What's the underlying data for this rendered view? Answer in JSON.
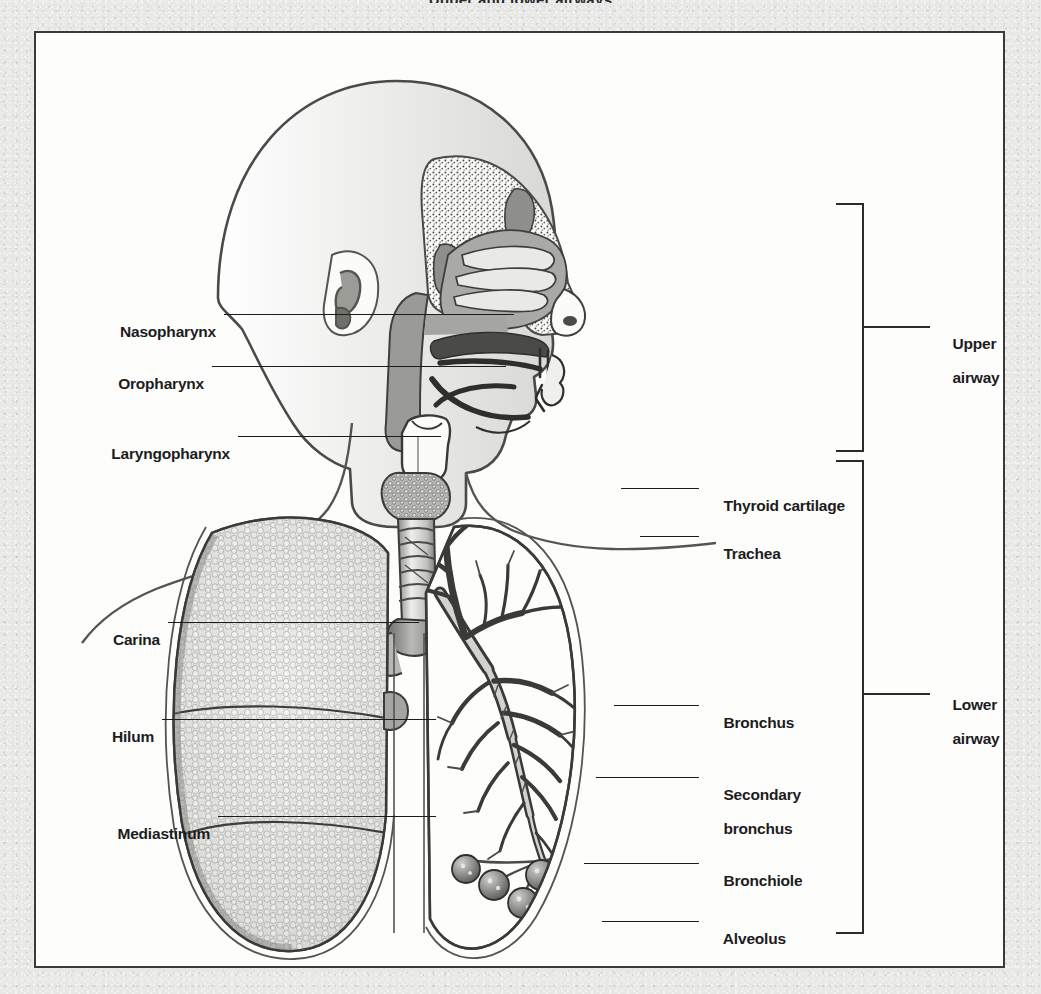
{
  "page": {
    "title_remnant": "Upper and lower airways",
    "background_color": "#e8e8e6",
    "frame_color": "#3a3a3a",
    "ink_color": "#1c1c1c"
  },
  "figure": {
    "left_labels": [
      {
        "id": "nasopharynx",
        "text": "Nasopharynx",
        "y": 281,
        "leader_from": 180,
        "leader_to": 478
      },
      {
        "id": "oropharynx",
        "text": "Oropharynx",
        "y": 333,
        "leader_from": 168,
        "leader_to": 470
      },
      {
        "id": "laryngopharynx",
        "text": "Laryngopharynx",
        "y": 403,
        "leader_from": 194,
        "leader_to": 405
      },
      {
        "id": "carina",
        "text": "Carina",
        "y": 589,
        "leader_from": 124,
        "leader_to": 383
      },
      {
        "id": "hilum",
        "text": "Hilum",
        "y": 686,
        "leader_from": 118,
        "leader_to": 400
      },
      {
        "id": "mediastinum",
        "text": "Mediastinum",
        "y": 783,
        "leader_from": 174,
        "leader_to": 400
      }
    ],
    "right_labels": [
      {
        "id": "thyroid-cartilage",
        "text": "Thyroid cartilage",
        "y": 455,
        "lines": [
          "Thyroid cartilage"
        ],
        "leader_from": 585,
        "leader_to": 663
      },
      {
        "id": "trachea",
        "text": "Trachea",
        "y": 503,
        "lines": [
          "Trachea"
        ],
        "leader_from": 604,
        "leader_to": 663
      },
      {
        "id": "bronchus",
        "text": "Bronchus",
        "y": 672,
        "lines": [
          "Bronchus"
        ],
        "leader_from": 578,
        "leader_to": 663
      },
      {
        "id": "secondary-bronchus",
        "text": "Secondary bronchus",
        "y": 744,
        "lines": [
          "Secondary",
          "bronchus"
        ],
        "leader_from": 560,
        "leader_to": 663
      },
      {
        "id": "bronchiole",
        "text": "Bronchiole",
        "y": 830,
        "lines": [
          "Bronchiole"
        ],
        "leader_from": 548,
        "leader_to": 663
      },
      {
        "id": "alveolus",
        "text": "Alveolus",
        "y": 888,
        "lines": [
          "Alveolus"
        ],
        "leader_from": 566,
        "leader_to": 663
      }
    ],
    "brackets": [
      {
        "id": "upper-airway",
        "lines": [
          "Upper",
          "airway"
        ],
        "top": 205,
        "bottom": 449,
        "x": 826,
        "tick_y": 333,
        "label_x": 900
      },
      {
        "id": "lower-airway",
        "lines": [
          "Lower",
          "airway"
        ],
        "top": 462,
        "bottom": 936,
        "x": 826,
        "tick_y": 695,
        "label_x": 900
      }
    ]
  }
}
